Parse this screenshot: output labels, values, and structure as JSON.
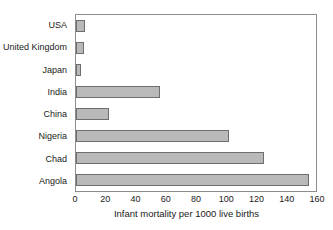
{
  "chart_data": {
    "type": "bar",
    "orientation": "horizontal",
    "title": "",
    "xlabel": "Infant mortality per 1000 live births",
    "ylabel": "",
    "categories": [
      "USA",
      "United Kingdom",
      "Japan",
      "India",
      "China",
      "Nigeria",
      "Chad",
      "Angola"
    ],
    "values": [
      6,
      5,
      3,
      56,
      22,
      102,
      125,
      155
    ],
    "xlim": [
      0,
      160
    ],
    "xticks": [
      0,
      20,
      40,
      60,
      80,
      100,
      120,
      140,
      160
    ],
    "xtick_labels": [
      "0",
      "20",
      "40",
      "60",
      "80",
      "100",
      "120",
      "140",
      "160"
    ],
    "grid": false,
    "legend": null,
    "bar_fill_color": "#b9b9b9",
    "bar_border_color": "#6e6e6e",
    "frame_color": "#8c8c8c"
  }
}
